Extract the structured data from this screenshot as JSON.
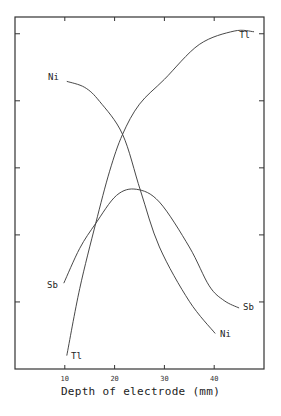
{
  "chart_data": {
    "type": "line",
    "title": "",
    "xlabel": "Depth of electrode (mm)",
    "ylabel": "",
    "xlim": [
      0,
      50
    ],
    "ylim": [
      0,
      5.25
    ],
    "x_ticks": [
      10,
      20,
      30,
      40
    ],
    "x_tick_labels": [
      "10",
      "20",
      "30",
      "40"
    ],
    "y_ticks": [
      1,
      2,
      3,
      4,
      5
    ],
    "y_tick_labels": [],
    "grid": false,
    "legend": "inline labels at curve ends",
    "series": [
      {
        "name": "Tl",
        "label_start": "Tl",
        "label_end": "Tl",
        "points": [
          [
            10.4,
            0.2
          ],
          [
            13,
            1.2
          ],
          [
            16.2,
            2.17
          ],
          [
            19,
            2.95
          ],
          [
            21.6,
            3.5
          ],
          [
            25,
            3.95
          ],
          [
            30,
            4.32
          ],
          [
            37,
            4.84
          ],
          [
            44,
            5.04
          ],
          [
            48,
            5.03
          ]
        ]
      },
      {
        "name": "Ni",
        "label_start": "Ni",
        "label_end": "Ni",
        "points": [
          [
            10.4,
            4.29
          ],
          [
            14,
            4.2
          ],
          [
            17,
            3.99
          ],
          [
            21.6,
            3.5
          ],
          [
            25.2,
            2.66
          ],
          [
            29,
            1.82
          ],
          [
            35,
            1.01
          ],
          [
            40.2,
            0.53
          ]
        ]
      },
      {
        "name": "Sb",
        "label_start": "Sb",
        "label_end": "Sb",
        "points": [
          [
            9.8,
            1.28
          ],
          [
            13,
            1.8
          ],
          [
            16.2,
            2.17
          ],
          [
            20.4,
            2.59
          ],
          [
            24.4,
            2.68
          ],
          [
            29,
            2.49
          ],
          [
            35,
            1.82
          ],
          [
            39,
            1.24
          ],
          [
            42,
            1.02
          ],
          [
            45,
            0.91
          ]
        ]
      }
    ]
  }
}
